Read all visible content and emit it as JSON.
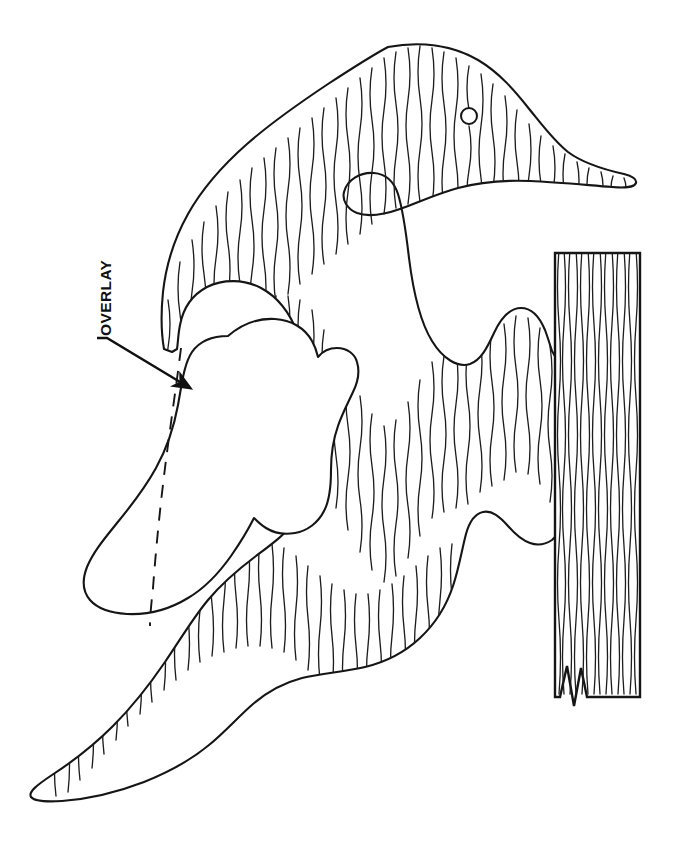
{
  "document": {
    "title": "Woodworking Pattern — Bird on Board",
    "kind": "line-art pattern diagram",
    "background_color": "#ffffff",
    "ink_color": "#151515",
    "grain_color": "#1d1d1d"
  },
  "annotations": {
    "overlay_label": "OVERLAY",
    "overlay_label_rotation_deg": -90,
    "leader": {
      "name": "overlay-leader-line",
      "from_x": 104,
      "from_y": 341,
      "to_x": 193,
      "to_y": 391,
      "has_arrowhead": true,
      "arrow_target": "overlay-piece"
    }
  },
  "parts": [
    {
      "id": "bird-body",
      "name": "bird-silhouette",
      "description": "Woodpecker / duck body with head, beak, neck notch, breast, tail",
      "hatched": true,
      "grain_direction": "vertical"
    },
    {
      "id": "overlay-piece",
      "name": "overlay-wing",
      "description": "Separate wing overlay piece, unhatched, with dashed hidden edge",
      "hatched": false,
      "dashed_hidden_edge": true
    },
    {
      "id": "mounting-board",
      "name": "mounting-board",
      "description": "Vertical wood board with grain and break line at bottom",
      "hatched": true,
      "grain_direction": "vertical",
      "break_line": "zigzag"
    }
  ],
  "features": {
    "eye": {
      "name": "bird-eye",
      "cx": 469,
      "cy": 116,
      "r": 8
    },
    "beak_tip": {
      "x": 636,
      "y": 181
    },
    "tail_tip": {
      "x": 31,
      "y": 799
    },
    "board": {
      "left": 554,
      "top": 252,
      "right": 641,
      "bottom": 698
    }
  }
}
